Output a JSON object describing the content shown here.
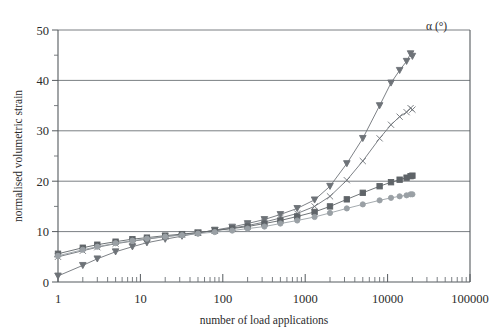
{
  "chart_data": {
    "type": "line",
    "title": "",
    "xlabel": "number of load applications",
    "ylabel": "normalised volumetric strain",
    "xscale": "log",
    "xlim": [
      1,
      100000
    ],
    "ylim": [
      0,
      50
    ],
    "xticks": [
      "1",
      "10",
      "100",
      "1000",
      "10000",
      "100000"
    ],
    "yticks": [
      "0",
      "10",
      "20",
      "30",
      "40",
      "50"
    ],
    "yminor": [
      5,
      15,
      25,
      35,
      45
    ],
    "grid": "horizontal-major",
    "legend_position": "inline-right",
    "legend_header": "α (°)",
    "series": [
      {
        "name": "67",
        "label": "67",
        "marker": "triangle-down",
        "color": "#6e7378",
        "x": [
          1,
          2,
          3,
          5,
          8,
          12,
          20,
          32,
          50,
          80,
          130,
          200,
          320,
          500,
          800,
          1300,
          2000,
          3200,
          5000,
          8000,
          11000,
          14000,
          17000,
          19000,
          20000
        ],
        "y": [
          1.2,
          3.3,
          4.6,
          6.0,
          7.0,
          7.8,
          8.5,
          9.1,
          9.7,
          10.3,
          10.9,
          11.6,
          12.4,
          13.4,
          14.6,
          16.3,
          19.0,
          23.5,
          28.5,
          35.0,
          39.5,
          42.0,
          43.8,
          45.3,
          44.8
        ]
      },
      {
        "name": "45",
        "label": "45",
        "marker": "cross",
        "color": "#6e7378",
        "x": [
          1,
          2,
          3,
          5,
          8,
          12,
          20,
          32,
          50,
          80,
          130,
          200,
          320,
          500,
          800,
          1300,
          2000,
          3200,
          5000,
          8000,
          11000,
          14000,
          17000,
          19000,
          20000
        ],
        "y": [
          5.0,
          6.2,
          6.9,
          7.6,
          8.1,
          8.5,
          9.0,
          9.4,
          9.8,
          10.2,
          10.7,
          11.2,
          11.9,
          12.7,
          13.6,
          15.0,
          17.0,
          20.2,
          24.0,
          28.5,
          31.2,
          32.8,
          33.7,
          34.5,
          34.2
        ]
      },
      {
        "name": "0",
        "label": "0",
        "marker": "square-filled",
        "color": "#5f6468",
        "x": [
          1,
          2,
          3,
          5,
          8,
          12,
          20,
          32,
          50,
          80,
          130,
          200,
          320,
          500,
          800,
          1300,
          2000,
          3200,
          5000,
          8000,
          11000,
          14000,
          17000,
          19000,
          20000
        ],
        "y": [
          5.6,
          6.8,
          7.4,
          8.0,
          8.5,
          8.8,
          9.2,
          9.5,
          9.8,
          10.2,
          10.6,
          11.0,
          11.6,
          12.2,
          13.0,
          13.9,
          15.0,
          16.4,
          17.7,
          19.0,
          19.8,
          20.3,
          20.7,
          21.0,
          21.1
        ]
      },
      {
        "name": "22",
        "label": "22",
        "marker": "circle",
        "color": "#9aa0a5",
        "x": [
          1,
          2,
          3,
          5,
          8,
          12,
          20,
          32,
          50,
          80,
          130,
          200,
          320,
          500,
          800,
          1300,
          2000,
          3200,
          5000,
          8000,
          11000,
          14000,
          17000,
          19000,
          20000
        ],
        "y": [
          5.2,
          6.4,
          7.0,
          7.7,
          8.2,
          8.6,
          9.0,
          9.3,
          9.6,
          9.9,
          10.2,
          10.6,
          11.0,
          11.6,
          12.2,
          12.9,
          13.7,
          14.6,
          15.4,
          16.2,
          16.7,
          17.0,
          17.2,
          17.4,
          17.4
        ]
      }
    ],
    "series_label_positions": [
      {
        "name": "67",
        "x": 420,
        "y": 73
      },
      {
        "name": "45",
        "x": 420,
        "y": 113
      },
      {
        "name": "0",
        "x": 420,
        "y": 174
      },
      {
        "name": "22",
        "x": 420,
        "y": 205
      }
    ]
  }
}
